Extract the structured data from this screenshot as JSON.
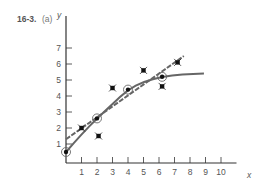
{
  "figure": {
    "number": "16-3.",
    "part": "(a)"
  },
  "chart_data": {
    "type": "scatter",
    "xlabel": "x",
    "ylabel": "y",
    "xlim": [
      0,
      11
    ],
    "ylim": [
      0,
      8
    ],
    "x_ticks": [
      1,
      2,
      3,
      4,
      5,
      6,
      7,
      8,
      9,
      10
    ],
    "y_ticks": [
      1,
      2,
      3,
      4,
      5,
      6,
      7
    ],
    "grid": false,
    "series": [
      {
        "name": "circled points",
        "marker": "circled-dot",
        "points": [
          [
            0,
            0.5
          ],
          [
            2,
            2.6
          ],
          [
            4,
            4.4
          ],
          [
            6.2,
            5.2
          ]
        ]
      },
      {
        "name": "star points",
        "marker": "star",
        "points": [
          [
            1,
            2.0
          ],
          [
            2.1,
            1.5
          ],
          [
            3,
            4.5
          ],
          [
            5,
            5.6
          ],
          [
            6.2,
            4.6
          ],
          [
            7.2,
            6.1
          ]
        ]
      },
      {
        "name": "dashed regression line",
        "style": "dashed",
        "points": [
          [
            0,
            1.3
          ],
          [
            7.6,
            6.5
          ]
        ]
      },
      {
        "name": "fitted curve",
        "style": "solid",
        "points": [
          [
            0,
            0.5
          ],
          [
            1,
            1.6
          ],
          [
            2,
            2.6
          ],
          [
            3,
            3.5
          ],
          [
            4,
            4.4
          ],
          [
            5,
            4.9
          ],
          [
            6.2,
            5.2
          ],
          [
            7.5,
            5.35
          ],
          [
            8.9,
            5.4
          ]
        ]
      }
    ],
    "colors": {
      "axis": "#333333",
      "line": "#666666",
      "marker": "#111111",
      "text": "#555555"
    }
  }
}
